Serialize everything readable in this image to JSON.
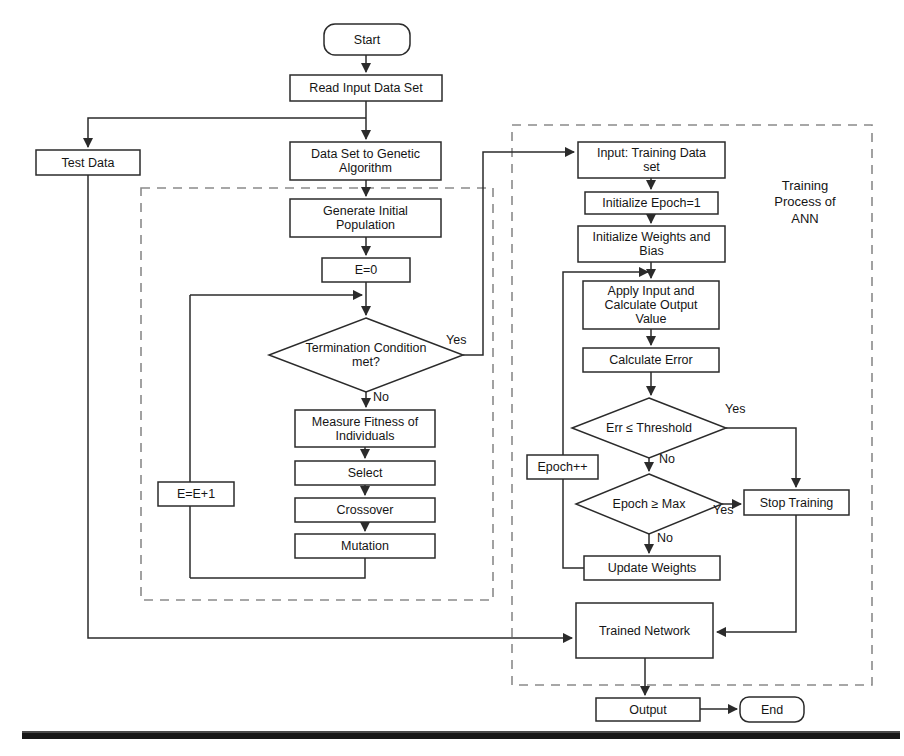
{
  "diagram": {
    "stroke_color": "#2b2b2b",
    "dashed_color": "#7b7b7b",
    "text_color": "#151515",
    "background": "#ffffff"
  },
  "groups": [
    {
      "id": "ga-group",
      "label": ""
    },
    {
      "id": "ann-group",
      "label": "Training\nProcess of\nANN",
      "label_line1": "Training",
      "label_line2": "Process of",
      "label_line3": "ANN"
    }
  ],
  "nodes": {
    "start": {
      "label": "Start",
      "shape": "rounded"
    },
    "read_input": {
      "label": "Read Input Data Set",
      "shape": "rect"
    },
    "test_data": {
      "label": "Test Data",
      "shape": "rect"
    },
    "dataset_to_ga": {
      "label": "Data Set to Genetic Algorithm",
      "line1": "Data Set to Genetic",
      "line2": "Algorithm",
      "shape": "rect"
    },
    "generate_initial_population": {
      "label": "Generate Initial Population",
      "line1": "Generate Initial",
      "line2": "Population",
      "shape": "rect"
    },
    "e_zero": {
      "label": "E=0",
      "shape": "rect"
    },
    "termination_condition": {
      "label": "Termination Condition met?",
      "line1": "Termination Condition",
      "line2": "met?",
      "shape": "diamond"
    },
    "measure_fitness": {
      "label": "Measure Fitness of Individuals",
      "line1": "Measure Fitness of",
      "line2": "Individuals",
      "shape": "rect"
    },
    "select": {
      "label": "Select",
      "shape": "rect"
    },
    "crossover": {
      "label": "Crossover",
      "shape": "rect"
    },
    "mutation": {
      "label": "Mutation",
      "shape": "rect"
    },
    "e_increment": {
      "label": "E=E+1",
      "shape": "rect"
    },
    "input_training_data": {
      "label": "Input: Training Data set",
      "line1": "Input: Training Data",
      "line2": "set",
      "shape": "rect"
    },
    "initialize_epoch": {
      "label": "Initialize Epoch=1",
      "shape": "rect"
    },
    "initialize_weights": {
      "label": "Initialize Weights and Bias",
      "line1": "Initialize Weights and",
      "line2": "Bias",
      "shape": "rect"
    },
    "apply_input": {
      "label": "Apply Input and Calculate Output Value",
      "line1": "Apply Input and",
      "line2": "Calculate Output",
      "line3": "Value",
      "shape": "rect"
    },
    "calculate_error": {
      "label": "Calculate Error",
      "shape": "rect"
    },
    "err_threshold": {
      "label": "Err ≤ Threshold",
      "shape": "diamond"
    },
    "epoch_max": {
      "label": "Epoch ≥ Max",
      "shape": "diamond"
    },
    "epoch_increment": {
      "label": "Epoch++",
      "shape": "rect"
    },
    "update_weights": {
      "label": "Update Weights",
      "shape": "rect"
    },
    "stop_training": {
      "label": "Stop Training",
      "shape": "rect"
    },
    "trained_network": {
      "label": "Trained Network",
      "shape": "rect"
    },
    "output": {
      "label": "Output",
      "shape": "rect"
    },
    "end": {
      "label": "End",
      "shape": "rounded"
    }
  },
  "edge_labels": {
    "termination_yes": "Yes",
    "termination_no": "No",
    "err_yes": "Yes",
    "err_no": "No",
    "epoch_yes": "Yes",
    "epoch_no": "No"
  }
}
